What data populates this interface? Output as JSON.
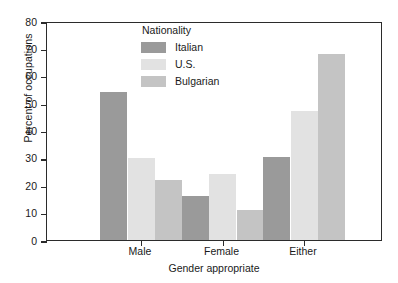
{
  "chart_data": {
    "type": "bar",
    "title": "",
    "xlabel": "Gender appropriate",
    "ylabel": "Percent of occupations",
    "categories": [
      "Male",
      "Female",
      "Either"
    ],
    "ylim": [
      0,
      80
    ],
    "yticks": [
      0,
      10,
      20,
      30,
      40,
      50,
      60,
      70,
      80
    ],
    "grid": false,
    "legend_title": "Nationality",
    "legend_position": "inside-top-center",
    "series": [
      {
        "name": "Italian",
        "values": [
          54,
          16,
          30.5
        ],
        "color": "#9a9a9a"
      },
      {
        "name": "U.S.",
        "values": [
          30,
          24,
          47
        ],
        "color": "#e2e2e2"
      },
      {
        "name": "Bulgarian",
        "values": [
          22,
          11,
          68
        ],
        "color": "#c4c4c4"
      }
    ]
  },
  "axis": {
    "y_title": "Percent of occupations",
    "x_title": "Gender appropriate",
    "y_labels": [
      "80",
      "70",
      "60",
      "50",
      "40",
      "30",
      "20",
      "10",
      "0"
    ],
    "x_labels": [
      "Male",
      "Female",
      "Either"
    ]
  },
  "legend": {
    "title": "Nationality",
    "entries": [
      {
        "label": "Italian"
      },
      {
        "label": "U.S."
      },
      {
        "label": "Bulgarian"
      }
    ]
  },
  "style": {
    "frame_color": "#2b2b2b",
    "background": "#ffffff",
    "italian_color": "#9a9a9a",
    "us_color": "#e2e2e2",
    "bulgarian_color": "#c4c4c4"
  }
}
